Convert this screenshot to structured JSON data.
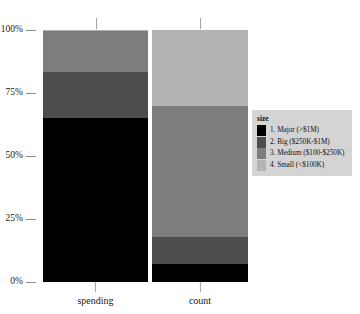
{
  "chart_data": {
    "type": "bar",
    "title": "",
    "subtitle": "",
    "xlabel": "",
    "ylabel": "",
    "stacked": true,
    "normalized": true,
    "grid": false,
    "legend_position": "right",
    "categories": [
      "spending",
      "count"
    ],
    "ylim": [
      0,
      100
    ],
    "yticks": [
      0,
      25,
      50,
      75,
      100
    ],
    "ytick_labels": [
      "0%",
      "25%",
      "50%",
      "75%",
      "100%"
    ],
    "legend_title": "size",
    "series": [
      {
        "name": "1. Major (>$1M)",
        "color": "#000000",
        "values": [
          65.0,
          7.0
        ]
      },
      {
        "name": "2. Big ($250K-$1M)",
        "color": "#4d4d4d",
        "values": [
          18.5,
          11.0
        ]
      },
      {
        "name": "3. Medium ($100-$250K)",
        "color": "#7d7d7d",
        "values": [
          16.0,
          52.0
        ]
      },
      {
        "name": "4. Small (<$100K)",
        "color": "#b3b3b3",
        "values": [
          0.5,
          30.0
        ]
      }
    ]
  },
  "axes": {
    "y_ticks": [
      {
        "label": "100%",
        "value": 100
      },
      {
        "label": "75%",
        "value": 75
      },
      {
        "label": "50%",
        "value": 50
      },
      {
        "label": "25%",
        "value": 25
      },
      {
        "label": "0%",
        "value": 0
      }
    ],
    "x_ticks": [
      {
        "label": "spending"
      },
      {
        "label": "count"
      }
    ]
  },
  "legend": {
    "title": "size",
    "items": [
      {
        "label": "1. Major (>$1M)",
        "color": "#000000"
      },
      {
        "label": "2. Big ($250K-$1M)",
        "color": "#4d4d4d"
      },
      {
        "label": "3. Medium ($100-$250K)",
        "color": "#7d7d7d"
      },
      {
        "label": "4. Small (<$100K)",
        "color": "#b3b3b3"
      }
    ]
  },
  "style": {
    "background": "#ffffff",
    "legend_background": "#d4d4d4",
    "tick_color": "#8d8d8d",
    "text_color": "#1a1a1a"
  }
}
